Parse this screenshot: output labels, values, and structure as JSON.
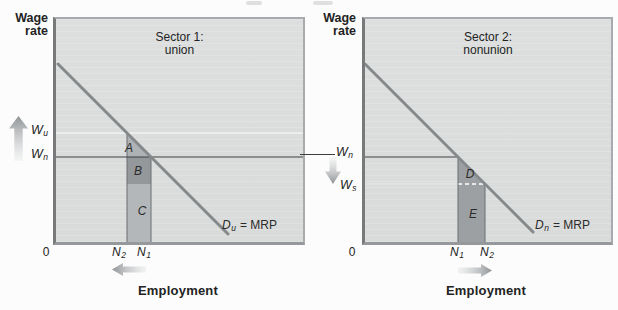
{
  "left": {
    "axis_label_line1": "Wage",
    "axis_label_line2": "rate",
    "title_line1": "Sector 1:",
    "title_line2": "union",
    "wu": {
      "base": "W",
      "sub": "u"
    },
    "wn": {
      "base": "W",
      "sub": "n"
    },
    "origin": "0",
    "tick1": {
      "base": "N",
      "sub": "2"
    },
    "tick2": {
      "base": "N",
      "sub": "1"
    },
    "region_a": "A",
    "region_b": "B",
    "region_c": "C",
    "curve_label": {
      "base": "D",
      "sub": "u",
      "rest": "= MRP"
    },
    "x_label": "Employment"
  },
  "middle": {
    "wn": {
      "base": "W",
      "sub": "n"
    },
    "ws": {
      "base": "W",
      "sub": "s"
    }
  },
  "right": {
    "axis_label_line1": "Wage",
    "axis_label_line2": "rate",
    "title_line1": "Sector 2:",
    "title_line2": "nonunion",
    "origin": "0",
    "tick1": {
      "base": "N",
      "sub": "1"
    },
    "tick2": {
      "base": "N",
      "sub": "2"
    },
    "region_d": "D",
    "region_e": "E",
    "curve_label": {
      "base": "D",
      "sub": "n",
      "rest": "= MRP"
    },
    "x_label": "Employment"
  },
  "colors": {
    "panel_bg": "#dcdedd",
    "region_a_fill": "#aeb2b4",
    "region_b_fill": "#94989b",
    "region_c_fill": "#b4b7b9",
    "region_de_fill": "#9da0a2",
    "demand_curve": "#85898b",
    "axis_dark": "#77797b",
    "wage_line": "#3c3e40",
    "arrow_gray": "#8f9396"
  }
}
